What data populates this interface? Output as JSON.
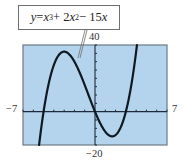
{
  "callout": {
    "equation_text": "y = x³ + 2x² − 15x",
    "parts": {
      "y": "y",
      "eq": " = ",
      "x1": "x",
      "exp1": "3",
      "plus": " + 2",
      "x2": "x",
      "exp2": "2",
      "minus": " − 15",
      "x3": "x"
    }
  },
  "labels": {
    "ymax": "40",
    "ymin": "−20",
    "xmin": "−7",
    "xmax": "7"
  },
  "colors": {
    "plot_background": "#b4d4ee",
    "frame": "#6b7a86",
    "axis": "#1e2a3a",
    "curve": "#101820"
  },
  "chart_data": {
    "type": "line",
    "function": "x^3 + 2x^2 - 15x",
    "xlabel": "",
    "ylabel": "",
    "xlim": [
      -7,
      7
    ],
    "ylim": [
      -20,
      40
    ],
    "x_tick_step": 1,
    "y_tick_step": 5,
    "grid": false,
    "legend": null,
    "annotations": [
      "y = x^3 + 2x^2 - 15x (callout pointing to curve)"
    ],
    "series": [
      {
        "name": "y = x^3 + 2x^2 - 15x",
        "x": [
          -6,
          -5.5,
          -5,
          -4.5,
          -4,
          -3.5,
          -3,
          -2.5,
          -2,
          -1.5,
          -1,
          -0.5,
          0,
          0.5,
          1,
          1.5,
          2,
          2.5,
          3,
          3.5,
          4
        ],
        "y": [
          -36,
          -16.88,
          0,
          13.5,
          20,
          28.88,
          36,
          34.38,
          30,
          23.63,
          16,
          7.88,
          0,
          -6.88,
          -12,
          -14.63,
          -14,
          -9.38,
          0,
          14.88,
          36
        ]
      }
    ],
    "key_points": {
      "roots": [
        -5,
        0,
        3
      ],
      "local_max": [
        -3,
        36
      ],
      "local_min": [
        1.67,
        -14.81
      ]
    }
  }
}
